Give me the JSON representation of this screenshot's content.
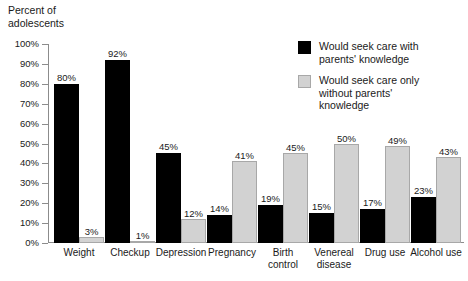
{
  "chart_data": {
    "type": "bar",
    "title": "",
    "xlabel": "",
    "ylabel": "Percent of\nadolescents",
    "ylim": [
      0,
      100
    ],
    "ytick_labels": [
      "0%",
      "10%",
      "20%",
      "30%",
      "40%",
      "50%",
      "60%",
      "70%",
      "80%",
      "90%",
      "100%"
    ],
    "ytick_values": [
      0,
      10,
      20,
      30,
      40,
      50,
      60,
      70,
      80,
      90,
      100
    ],
    "grid": false,
    "legend_position": "top-right",
    "categories": [
      "Weight",
      "Checkup",
      "Depression",
      "Pregnancy",
      "Birth\ncontrol",
      "Venereal\ndisease",
      "Drug use",
      "Alcohol use"
    ],
    "series": [
      {
        "name": "Would seek care with\nparents' knowledge",
        "color": "#000000",
        "values": [
          80,
          92,
          45,
          14,
          19,
          15,
          17,
          23
        ],
        "value_labels": [
          "80%",
          "92%",
          "45%",
          "14%",
          "19%",
          "15%",
          "17%",
          "23%"
        ]
      },
      {
        "name": "Would seek care only\nwithout parents'\nknowledge",
        "color": "#d2d2d2",
        "values": [
          3,
          1,
          12,
          41,
          45,
          50,
          49,
          43
        ],
        "value_labels": [
          "3%",
          "1%",
          "12%",
          "41%",
          "45%",
          "50%",
          "49%",
          "43%"
        ]
      }
    ]
  }
}
